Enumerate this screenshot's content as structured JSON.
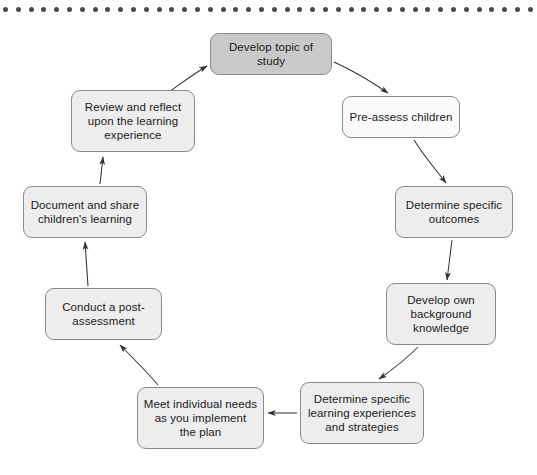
{
  "page": {
    "background_color": "#ffffff",
    "decoration": {
      "name": "dotted-rule",
      "dot_color": "#4a4a4a",
      "dot_count": 42,
      "dot_spacing_px": 12.8,
      "dot_diameter_px": 5
    }
  },
  "diagram": {
    "type": "cycle-flowchart",
    "direction": "clockwise",
    "node_fill_default": "#ededed",
    "node_fill_accent": "#c9c9c9",
    "node_border_color": "#8a8a8a",
    "arrow_color": "#333333",
    "nodes": [
      {
        "id": "develop-topic-of-study",
        "label": "Develop topic of study",
        "lines": [
          "Develop topic of study"
        ],
        "highlighted": true,
        "fill": "#c9c9c9",
        "x": 210,
        "y": 33,
        "w": 122,
        "h": 42
      },
      {
        "id": "pre-assess-children",
        "label": "Pre-assess children",
        "lines": [
          "Pre-assess children"
        ],
        "highlighted": false,
        "fill": "#fafafa",
        "x": 342,
        "y": 96,
        "w": 118,
        "h": 42
      },
      {
        "id": "determine-specific-outcomes",
        "label": "Determine specific outcomes",
        "lines": [
          "Determine specific",
          "outcomes"
        ],
        "highlighted": false,
        "fill": "#ededed",
        "x": 395,
        "y": 186,
        "w": 118,
        "h": 52
      },
      {
        "id": "develop-own-background-knowledge",
        "label": "Develop own background knowledge",
        "lines": [
          "Develop own",
          "background",
          "knowledge"
        ],
        "highlighted": false,
        "fill": "#ededed",
        "x": 386,
        "y": 283,
        "w": 110,
        "h": 62
      },
      {
        "id": "determine-specific-learning-experiences-and-strategies",
        "label": "Determine specific learning experiences and strategies",
        "lines": [
          "Determine specific",
          "learning experiences",
          "and strategies"
        ],
        "highlighted": false,
        "fill": "#ededed",
        "x": 300,
        "y": 382,
        "w": 124,
        "h": 62
      },
      {
        "id": "meet-individual-needs-as-you-implement-the-plan",
        "label": "Meet individual needs as you implement the plan",
        "lines": [
          "Meet individual needs",
          "as you implement",
          "the plan"
        ],
        "highlighted": false,
        "fill": "#ededed",
        "x": 137,
        "y": 387,
        "w": 127,
        "h": 62
      },
      {
        "id": "conduct-a-post-assessment",
        "label": "Conduct a post-assessment",
        "lines": [
          "Conduct a post-",
          "assessment"
        ],
        "highlighted": false,
        "fill": "#ededed",
        "x": 45,
        "y": 288,
        "w": 117,
        "h": 52
      },
      {
        "id": "document-and-share-childrens-learning",
        "label": "Document and share children's learning",
        "lines": [
          "Document and share",
          "children's learning"
        ],
        "highlighted": false,
        "fill": "#ededed",
        "x": 23,
        "y": 186,
        "w": 124,
        "h": 52
      },
      {
        "id": "review-and-reflect-upon-the-learning-experience",
        "label": "Review and reflect upon the learning experience",
        "lines": [
          "Review and reflect",
          "upon the learning",
          "experience"
        ],
        "highlighted": false,
        "fill": "#ededed",
        "x": 71,
        "y": 90,
        "w": 124,
        "h": 62
      }
    ],
    "edges": [
      {
        "id": "edge-develop-topic-to-pre-assess",
        "from": "develop-topic-of-study",
        "to": "pre-assess-children"
      },
      {
        "id": "edge-pre-assess-to-determine-outcomes",
        "from": "pre-assess-children",
        "to": "determine-specific-outcomes"
      },
      {
        "id": "edge-determine-outcomes-to-background-knowledge",
        "from": "determine-specific-outcomes",
        "to": "develop-own-background-knowledge"
      },
      {
        "id": "edge-background-knowledge-to-learning-experiences",
        "from": "develop-own-background-knowledge",
        "to": "determine-specific-learning-experiences-and-strategies"
      },
      {
        "id": "edge-learning-experiences-to-meet-individual-needs",
        "from": "determine-specific-learning-experiences-and-strategies",
        "to": "meet-individual-needs-as-you-implement-the-plan"
      },
      {
        "id": "edge-meet-individual-needs-to-post-assessment",
        "from": "meet-individual-needs-as-you-implement-the-plan",
        "to": "conduct-a-post-assessment"
      },
      {
        "id": "edge-post-assessment-to-document-and-share",
        "from": "conduct-a-post-assessment",
        "to": "document-and-share-childrens-learning"
      },
      {
        "id": "edge-document-and-share-to-review-and-reflect",
        "from": "document-and-share-childrens-learning",
        "to": "review-and-reflect-upon-the-learning-experience"
      },
      {
        "id": "edge-review-and-reflect-to-develop-topic",
        "from": "review-and-reflect-upon-the-learning-experience",
        "to": "develop-topic-of-study"
      }
    ]
  }
}
